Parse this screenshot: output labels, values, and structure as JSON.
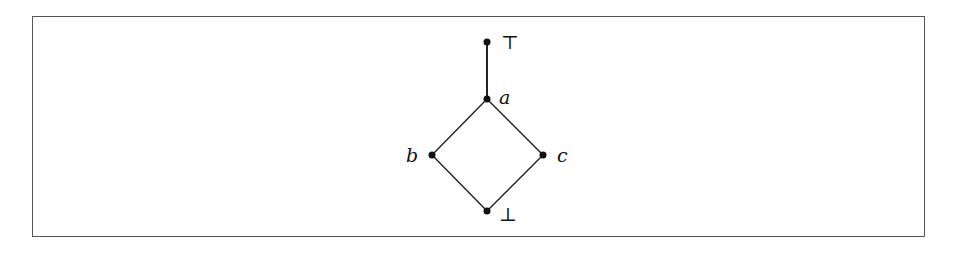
{
  "diagram": {
    "type": "hasse-diagram",
    "nodes": [
      {
        "id": "top",
        "label": "⊤",
        "x": 487,
        "y": 42,
        "italic": false,
        "label_dx": 14,
        "label_dy": 7
      },
      {
        "id": "a",
        "label": "a",
        "x": 487,
        "y": 99,
        "italic": true,
        "label_dx": 12,
        "label_dy": 5
      },
      {
        "id": "b",
        "label": "b",
        "x": 432,
        "y": 155,
        "italic": true,
        "label_dx": -26,
        "label_dy": 7
      },
      {
        "id": "c",
        "label": "c",
        "x": 543,
        "y": 155,
        "italic": true,
        "label_dx": 14,
        "label_dy": 7
      },
      {
        "id": "bottom",
        "label": "⊥",
        "x": 487,
        "y": 211,
        "italic": false,
        "label_dx": 12,
        "label_dy": 10
      }
    ],
    "edges": [
      {
        "from": "top",
        "to": "a"
      },
      {
        "from": "a",
        "to": "b"
      },
      {
        "from": "a",
        "to": "c"
      },
      {
        "from": "b",
        "to": "bottom"
      },
      {
        "from": "c",
        "to": "bottom"
      }
    ],
    "colors": {
      "line": "#222222",
      "node": "#111111",
      "frame": "#555555"
    }
  }
}
